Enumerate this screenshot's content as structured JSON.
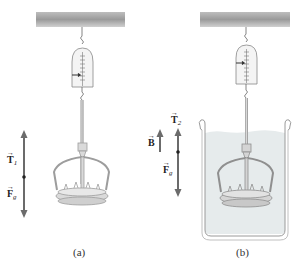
{
  "figure": {
    "panels": [
      {
        "id": "a",
        "caption": "(a)",
        "vectors": [
          {
            "symbol": "T",
            "subscript": "1",
            "direction": "up"
          },
          {
            "symbol": "F",
            "subscript": "g",
            "direction": "down"
          }
        ],
        "submerged": false
      },
      {
        "id": "b",
        "caption": "(b)",
        "vectors": [
          {
            "symbol": "B",
            "subscript": "",
            "direction": "up"
          },
          {
            "symbol": "T",
            "subscript": "2",
            "direction": "up"
          },
          {
            "symbol": "F",
            "subscript": "g",
            "direction": "down"
          }
        ],
        "submerged": true
      }
    ],
    "labels": {
      "a_T": "T",
      "a_T_sub": "1",
      "a_F": "F",
      "a_F_sub": "g",
      "b_B": "B",
      "b_T": "T",
      "b_T_sub": "2",
      "b_F": "F",
      "b_F_sub": "g",
      "vec_arrow": "→",
      "caption_a": "(a)",
      "caption_b": "(b)"
    },
    "colors": {
      "ceiling_dark": "#8a8a8a",
      "ceiling_light": "#d6d6d6",
      "vector": "#6b6b6b",
      "water": "#e6ebec",
      "crown": "#bdbdbd"
    }
  }
}
